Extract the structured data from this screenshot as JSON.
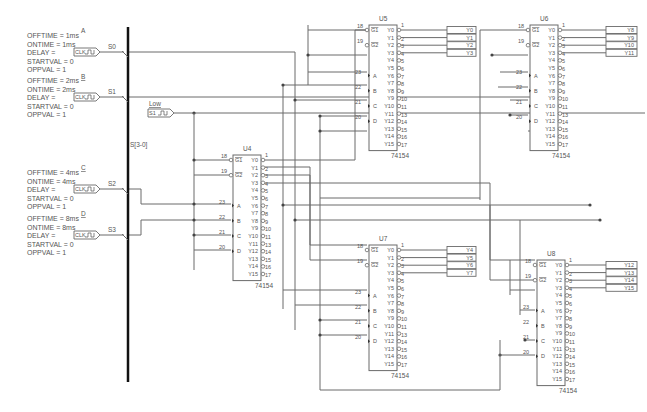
{
  "bus": {
    "label": "S[3-0]"
  },
  "sources": [
    {
      "name": "A",
      "net": "S0",
      "clk": "CLK",
      "attrs": [
        "OFFTIME = 1ms",
        "ONTIME = 1ms",
        "DELAY =",
        "STARTVAL = 0",
        "OPPVAL = 1"
      ]
    },
    {
      "name": "B",
      "net": "S1",
      "clk": "CLK",
      "attrs": [
        "OFFTIME = 2ms",
        "ONTIME = 2ms",
        "DELAY =",
        "STARTVAL = 0",
        "OPPVAL = 1"
      ]
    },
    {
      "name": "C",
      "net": "S2",
      "clk": "CLK",
      "attrs": [
        "OFFTIME = 4ms",
        "ONTIME = 4ms",
        "DELAY =",
        "STARTVAL = 0",
        "OPPVAL = 1"
      ]
    },
    {
      "name": "D",
      "net": "S3",
      "clk": "CLK",
      "attrs": [
        "OFFTIME = 8ms",
        "ONTIME = 8ms",
        "DELAY =",
        "STARTVAL = 0",
        "OPPVAL = 1"
      ]
    }
  ],
  "low_source": {
    "label": "Low",
    "net": "S1"
  },
  "chip_part": "74154",
  "pin_labels": {
    "g1": "G1",
    "g2": "G2",
    "g1_pin": "18",
    "g2_pin": "19",
    "a": "A",
    "b": "B",
    "c": "C",
    "d": "D",
    "a_pin": "23",
    "b_pin": "22",
    "c_pin": "21",
    "d_pin": "20",
    "outputs": [
      "Y0",
      "Y1",
      "Y2",
      "Y3",
      "Y4",
      "Y5",
      "Y6",
      "Y7",
      "Y8",
      "Y9",
      "Y10",
      "Y11",
      "Y12",
      "Y13",
      "Y14",
      "Y15"
    ],
    "output_pins": [
      "1",
      "2",
      "3",
      "4",
      "5",
      "6",
      "7",
      "8",
      "9",
      "10",
      "11",
      "13",
      "14",
      "15",
      "16",
      "17"
    ]
  },
  "chips": [
    {
      "ref": "U4",
      "outputs": []
    },
    {
      "ref": "U5",
      "outputs": [
        "Y0",
        "Y1",
        "Y2",
        "Y3"
      ]
    },
    {
      "ref": "U6",
      "outputs": [
        "Y8",
        "Y9",
        "Y10",
        "Y11"
      ]
    },
    {
      "ref": "U7",
      "outputs": [
        "Y4",
        "Y5",
        "Y6",
        "Y7"
      ]
    },
    {
      "ref": "U8",
      "outputs": [
        "Y12",
        "Y13",
        "Y14",
        "Y15"
      ]
    }
  ]
}
